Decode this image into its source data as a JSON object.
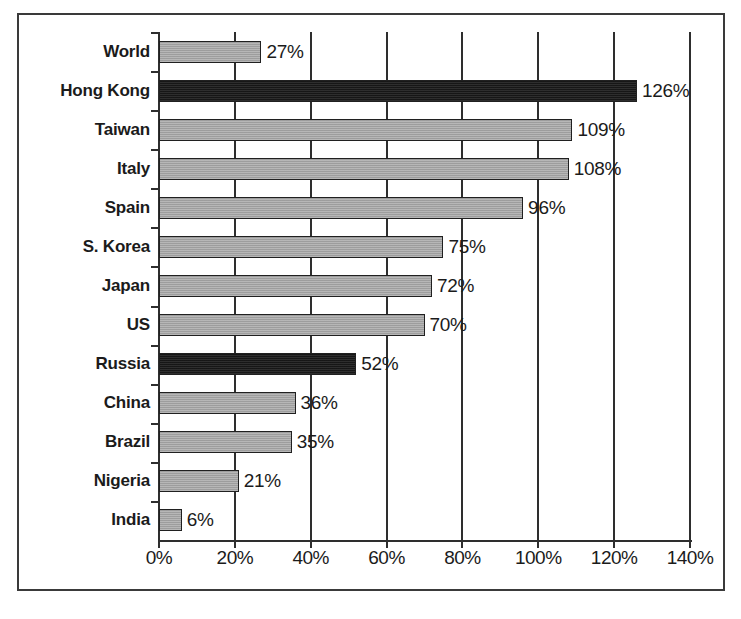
{
  "chart_data": {
    "type": "bar",
    "orientation": "horizontal",
    "title": "",
    "subtitle": "",
    "xlabel": "",
    "ylabel": "",
    "xlim": [
      0,
      140
    ],
    "grid": true,
    "legend": false,
    "value_suffix": "%",
    "xticks": [
      "0%",
      "20%",
      "40%",
      "60%",
      "80%",
      "100%",
      "120%",
      "140%"
    ],
    "xtick_values": [
      0,
      20,
      40,
      60,
      80,
      100,
      120,
      140
    ],
    "categories": [
      "World",
      "Hong Kong",
      "Taiwan",
      "Italy",
      "Spain",
      "S. Korea",
      "Japan",
      "US",
      "Russia",
      "China",
      "Brazil",
      "Nigeria",
      "India"
    ],
    "values": [
      27,
      126,
      109,
      108,
      96,
      75,
      72,
      70,
      52,
      36,
      35,
      21,
      6
    ],
    "data_labels": [
      "27%",
      "126%",
      "109%",
      "108%",
      "96%",
      "75%",
      "72%",
      "70%",
      "52%",
      "36%",
      "35%",
      "21%",
      "6%"
    ],
    "bar_styles": [
      "light",
      "dark",
      "light",
      "light",
      "light",
      "light",
      "light",
      "light",
      "dark",
      "light",
      "light",
      "light",
      "light"
    ],
    "colors": {
      "light_bar": "#a9a9a9",
      "dark_bar": "#1e1e1e",
      "bar_border": "#202020",
      "axis": "#2e2e2e",
      "text": "#1b1b1b",
      "frame": "#3a3a3a",
      "background": "#ffffff"
    }
  },
  "figure": {
    "caption": ""
  }
}
